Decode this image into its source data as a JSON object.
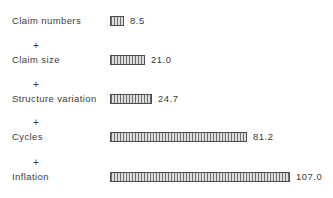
{
  "chart_data": {
    "type": "bar",
    "orientation": "horizontal",
    "title": "",
    "xlabel": "",
    "ylabel": "",
    "categories": [
      "Claim numbers",
      "Claim size",
      "Structure variation",
      "Cycles",
      "Inflation"
    ],
    "plus_prefixes": [
      "",
      "+",
      "+",
      "+",
      "+"
    ],
    "values": [
      8.5,
      21.0,
      24.7,
      81.2,
      107.0
    ],
    "value_labels": [
      "8.5",
      "21.0",
      "24.7",
      "81.2",
      "107.0"
    ],
    "xlim": [
      0,
      120
    ],
    "grid": false,
    "legend": false,
    "bar_style": "vertical-hatch",
    "colors": {
      "background": "#ffffff",
      "bar_fill": "#dedede",
      "bar_hatch": "#6e6e6e",
      "bar_border": "#4d4d4d",
      "text": "#3b3b3b"
    }
  }
}
